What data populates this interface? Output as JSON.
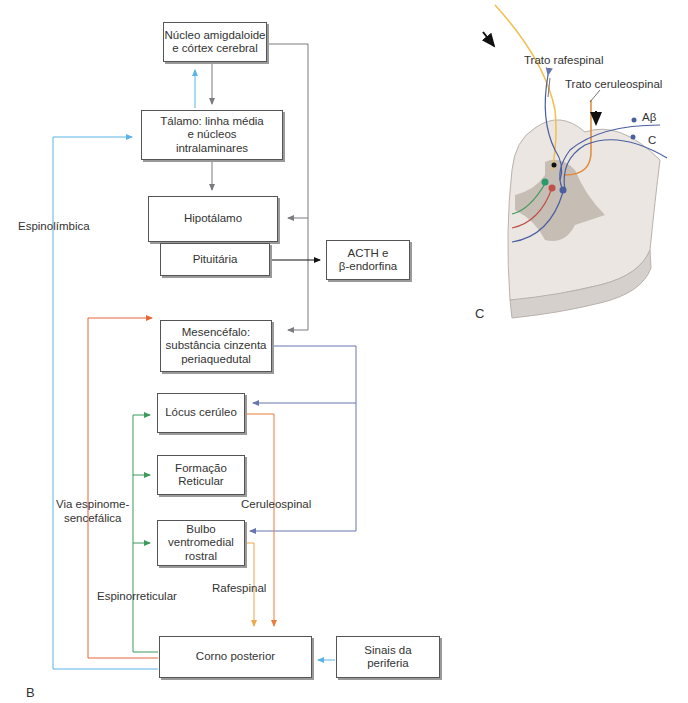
{
  "panel_b": {
    "label": "B",
    "boxes": {
      "amygdala": "Núcleo amigdaloide\ne córtex cerebral",
      "thalamus": "Tálamo: linha média\ne núcleos\nintralaminares",
      "hypothalamus": "Hipotálamo",
      "pituitary": "Pituitária",
      "acth": "ACTH e\nβ-endorfina",
      "midbrain": "Mesencéfalo:\nsubstância cinzenta\nperiaquedutal",
      "locus": "Lócus cerúleo",
      "reticular": "Formação\nReticular",
      "bulbo": "Bulbo\nventromedial\nrostral",
      "dorsal_horn": "Corno posterior",
      "periphery": "Sinais da\nperiferia"
    },
    "pathway_labels": {
      "spinolimbic": "Espinolímbica",
      "spinomesencephalic": "Via espinome-\nsencefálica",
      "spinoreticular": "Espinorreticular",
      "ceruleospinal": "Ceruleospinal",
      "raphespinal": "Rafespinal"
    },
    "colors": {
      "spinolimbic": "#5bb3e6",
      "spinomesencephalic": "#e8653a",
      "spinoreticular": "#3d9a5a",
      "ceruleospinal": "#e87d3e",
      "raphespinal": "#f0a84a",
      "descending_gray": "#7a7a80",
      "midbrain_blue": "#6677b0"
    }
  },
  "panel_c": {
    "label": "C",
    "labels": {
      "raphespinal_tract": "Trato rafespinal",
      "ceruleospinal_tract": "Trato ceruleospinal",
      "abeta": "Aβ",
      "c_fiber": "C"
    }
  }
}
